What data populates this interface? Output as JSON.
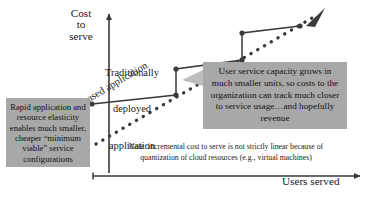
{
  "diagram": {
    "title_hidden": "",
    "axes": {
      "y_label": "Cost\nto\nserve",
      "x_label": "Users served"
    },
    "series": [
      {
        "name": "traditional",
        "label": "Traditionally\ndeployed\napplication",
        "style": "solid-step",
        "color": "#3a3a3a"
      },
      {
        "name": "cloud",
        "label": "Cloud-based application",
        "style": "dotted-arrow",
        "color": "#3a3a3a"
      }
    ],
    "callouts": [
      {
        "id": "left",
        "text": "Rapid application and resource elasticity enables much smaller, cheaper “minimum viable” service configurations",
        "bg": "#a8a8a8"
      },
      {
        "id": "right",
        "text": "User service capacity grows in much smaller units, so costs to the organization can track much closer to service usage…and hopefully revenue",
        "bg": "#a8a8a8"
      }
    ],
    "note": {
      "line1": "Note: incremental cost to serve is not strictly linear because of",
      "line2": "quantization of cloud resources (e.g., virtual machines)"
    },
    "colors": {
      "ink": "#3a3a3a",
      "callout_bg": "#a8a8a8",
      "background": "#ffffff"
    }
  },
  "chart_data": {
    "type": "line",
    "xlabel": "Users served",
    "ylabel": "Cost to serve",
    "grid": false,
    "legend": "inline-annotations",
    "series": [
      {
        "name": "Traditionally deployed application",
        "style": "step",
        "points": [
          {
            "x": 0,
            "y": 0
          },
          {
            "x": 56,
            "y": 0
          },
          {
            "x": 56,
            "y": 28
          },
          {
            "x": 118,
            "y": 24
          },
          {
            "x": 118,
            "y": 52
          },
          {
            "x": 180,
            "y": 48
          }
        ]
      },
      {
        "name": "Cloud-based application",
        "style": "dotted",
        "points": [
          {
            "x": 10,
            "y": -4
          },
          {
            "x": 190,
            "y": 66
          }
        ]
      }
    ]
  }
}
